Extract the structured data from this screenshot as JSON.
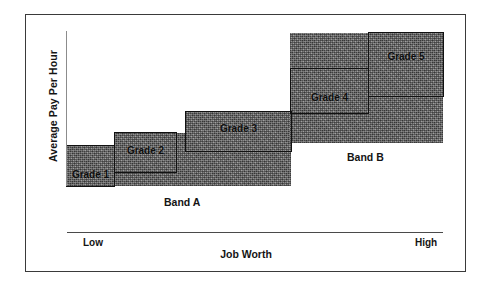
{
  "axes": {
    "y_title": "Average Pay Per Hour",
    "x_title": "Job Worth",
    "x_tick_low": "Low",
    "x_tick_high": "High"
  },
  "bands": [
    {
      "id": "band-a",
      "label": "Band A"
    },
    {
      "id": "band-b",
      "label": "Band B"
    }
  ],
  "grades": [
    {
      "id": "grade-1",
      "label": "Grade 1",
      "band": "Band A"
    },
    {
      "id": "grade-2",
      "label": "Grade 2",
      "band": "Band A"
    },
    {
      "id": "grade-3",
      "label": "Grade 3",
      "band": "Band A"
    },
    {
      "id": "grade-4",
      "label": "Grade 4",
      "band": "Band B"
    },
    {
      "id": "grade-5",
      "label": "Grade 5",
      "band": "Band B"
    }
  ],
  "colors": {
    "band_fill": "#6e6e6e",
    "outline": "#111111",
    "frame": "#3a3a3a",
    "axis": "#4a4a4a",
    "text": "#141414",
    "background": "#ffffff"
  },
  "chart_data": {
    "type": "bar",
    "title": "",
    "xlabel": "Job Worth",
    "ylabel": "Average Pay Per Hour",
    "grid": false,
    "legend": "none",
    "xlim": [
      "Low",
      "High"
    ],
    "annotations": [
      "Band A",
      "Band B"
    ],
    "categories": [
      "Grade 1",
      "Grade 2",
      "Grade 3",
      "Grade 4",
      "Grade 5"
    ],
    "series": [
      {
        "name": "Pay range per grade (relative units)",
        "x_start": [
          0,
          13,
          32,
          60,
          80
        ],
        "x_end": [
          13,
          32,
          60,
          80,
          100
        ],
        "pay_min": [
          0,
          9,
          22,
          47,
          61
        ],
        "pay_max": [
          27,
          34,
          45,
          77,
          100
        ]
      }
    ],
    "bands": [
      {
        "name": "Band A",
        "grades": [
          "Grade 1",
          "Grade 2",
          "Grade 3"
        ],
        "x_start": 0,
        "x_end": 60
      },
      {
        "name": "Band B",
        "grades": [
          "Grade 4",
          "Grade 5"
        ],
        "x_start": 60,
        "x_end": 100
      }
    ]
  }
}
